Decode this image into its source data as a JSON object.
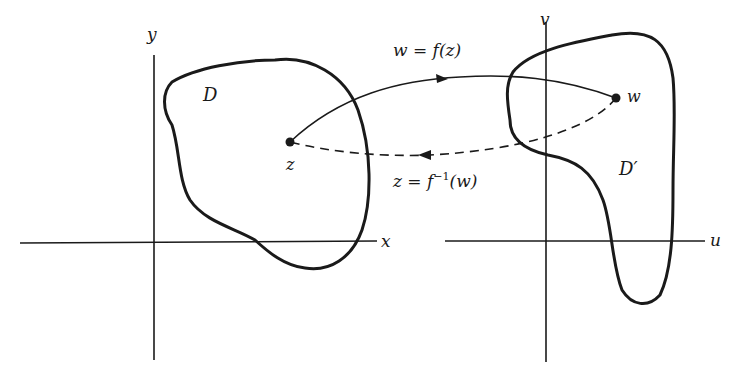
{
  "figure": {
    "z_plane": {
      "horizontal_axis_label": "x",
      "vertical_axis_label": "y",
      "region_label": "D",
      "point_label": "z"
    },
    "w_plane": {
      "horizontal_axis_label": "u",
      "vertical_axis_label": "v",
      "region_label": "D′",
      "point_label": "w"
    },
    "forward_map": {
      "label_lhs": "w = f(z)",
      "style": "solid",
      "direction": "z to w"
    },
    "inverse_map": {
      "label_prefix": "z = f",
      "label_superscript": "−1",
      "label_suffix": "(w)",
      "style": "dashed",
      "direction": "w to z"
    },
    "colors": {
      "ink": "#1a1a1a",
      "background": "#ffffff"
    }
  }
}
